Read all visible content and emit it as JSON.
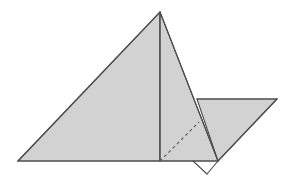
{
  "figure": {
    "title": "Folded paper geometric figure",
    "canvas": {
      "width": 291,
      "height": 184,
      "background_color": "#ffffff"
    },
    "style": {
      "fill_color": "#d2d2d2",
      "stroke_color": "#4d4d4d",
      "stroke_width": 1.1,
      "dash_stroke_color": "#555555",
      "dash_pattern": "3 3",
      "dash_stroke_width": 1.1
    },
    "vertices": {
      "apex": {
        "x": 160,
        "y": 12
      },
      "base_left": {
        "x": 18,
        "y": 161
      },
      "base_mid": {
        "x": 160,
        "y": 161
      },
      "base_notch_left": {
        "x": 193,
        "y": 161
      },
      "base_right": {
        "x": 218,
        "y": 161
      },
      "notch_bottom": {
        "x": 207,
        "y": 174
      },
      "flap_top_left": {
        "x": 197,
        "y": 99
      },
      "flap_top_right": {
        "x": 277,
        "y": 99
      }
    },
    "shapes": [
      {
        "name": "main-left-triangle",
        "type": "polygon",
        "points": "18,161 160,12 160,161",
        "filled": true
      },
      {
        "name": "main-right-triangle",
        "type": "polygon",
        "points": "160,12 218,161 160,161",
        "filled": true
      },
      {
        "name": "folded-flap-triangle",
        "type": "polygon",
        "points": "197,99 277,99 218,161",
        "filled": true
      }
    ],
    "lines": [
      {
        "name": "left-slope-edge",
        "x1": 18,
        "y1": 161,
        "x2": 160,
        "y2": 12
      },
      {
        "name": "right-slope-edge",
        "x1": 160,
        "y1": 12,
        "x2": 218,
        "y2": 161
      },
      {
        "name": "baseline",
        "x1": 18,
        "y1": 161,
        "x2": 218,
        "y2": 161
      },
      {
        "name": "vertical-crease-line",
        "x1": 160,
        "y1": 12,
        "x2": 160,
        "y2": 161
      },
      {
        "name": "flap-top-edge",
        "x1": 197,
        "y1": 99,
        "x2": 277,
        "y2": 99
      },
      {
        "name": "flap-right-edge",
        "x1": 277,
        "y1": 99,
        "x2": 218,
        "y2": 161
      },
      {
        "name": "notch-left-edge",
        "x1": 193,
        "y1": 161,
        "x2": 207,
        "y2": 174
      },
      {
        "name": "notch-right-edge",
        "x1": 207,
        "y1": 174,
        "x2": 218,
        "y2": 161
      }
    ],
    "dashed_lines": [
      {
        "name": "dashed-fold-line",
        "x1": 160,
        "y1": 161,
        "x2": 199,
        "y2": 122
      }
    ]
  }
}
